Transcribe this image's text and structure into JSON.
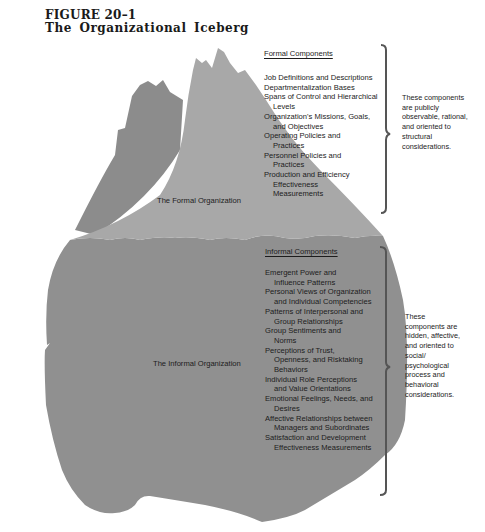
{
  "figure": {
    "number": "FIGURE 20–1",
    "title": "The Organizational Iceberg"
  },
  "colors": {
    "formal_fill": "#a8a8a8",
    "shoulder_fill": "#8c8c8c",
    "informal_fill": "#909090",
    "bracket": "#555555",
    "text": "#1c1c1c"
  },
  "formal": {
    "region_label": "The Formal Organization",
    "heading": "Formal Components",
    "items": [
      "Job Definitions and Descriptions",
      "Departmentalization Bases",
      "Spans of Control and Hierarchical Levels",
      "Organization's Missions, Goals, and Objectives",
      "Operating Policies and Practices",
      "Personnel Policies and Practices",
      "Production and Efficiency Effectiveness Measurements"
    ],
    "note": "These components are publicly observable, rational, and oriented to structural considerations."
  },
  "informal": {
    "region_label": "The Informal Organization",
    "heading": "Informal Components",
    "items": [
      "Emergent Power and Influence Patterns",
      "Personal Views of Organization and Individual Competencies",
      "Patterns of Interpersonal and Group Relationships",
      "Group Sentiments and Norms",
      "Perceptions of Trust, Openness, and Risktaking Behaviors",
      "Individual Role Perceptions and Value Orientations",
      "Emotional Feelings, Needs, and Desires",
      "Affective Relationships between Managers and Subordinates",
      "Satisfaction and Development Effectiveness Measurements"
    ],
    "note": "These components are hidden, affective, and oriented to social/ psychological process and behavioral considerations."
  }
}
